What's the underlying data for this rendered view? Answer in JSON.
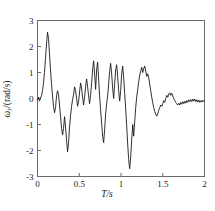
{
  "chart_data": {
    "type": "line",
    "title": "",
    "xlabel": "T/s",
    "ylabel": "ωy/(rad/s)",
    "ylabel_symbol": "ω",
    "ylabel_subscript": "y",
    "ylabel_unit": "/(rad/s)",
    "xlim": [
      0,
      2
    ],
    "ylim": [
      -3,
      3
    ],
    "xticks": [
      0,
      0.5,
      1,
      1.5,
      2
    ],
    "xtick_labels": [
      "0",
      "0.5",
      "1",
      "1.5",
      "2"
    ],
    "yticks": [
      -3,
      -2,
      -1,
      0,
      1,
      2,
      3
    ],
    "ytick_labels": [
      "-3",
      "-2",
      "-1",
      "0",
      "1",
      "2",
      "3"
    ],
    "grid": false,
    "legend": false,
    "line_color": "#1a1a1a",
    "line_width": 0.9,
    "frame": true,
    "tick_direction": "in",
    "series": [
      {
        "name": "angular velocity y",
        "x": [
          0.0,
          0.012,
          0.024,
          0.036,
          0.048,
          0.06,
          0.072,
          0.084,
          0.096,
          0.108,
          0.12,
          0.132,
          0.144,
          0.156,
          0.168,
          0.18,
          0.192,
          0.204,
          0.216,
          0.228,
          0.24,
          0.252,
          0.264,
          0.276,
          0.288,
          0.3,
          0.312,
          0.324,
          0.336,
          0.348,
          0.36,
          0.372,
          0.384,
          0.396,
          0.408,
          0.42,
          0.432,
          0.444,
          0.456,
          0.468,
          0.48,
          0.492,
          0.504,
          0.516,
          0.528,
          0.54,
          0.552,
          0.564,
          0.576,
          0.588,
          0.6,
          0.612,
          0.624,
          0.636,
          0.648,
          0.66,
          0.672,
          0.684,
          0.696,
          0.708,
          0.72,
          0.732,
          0.744,
          0.756,
          0.768,
          0.78,
          0.792,
          0.804,
          0.816,
          0.828,
          0.84,
          0.852,
          0.864,
          0.876,
          0.888,
          0.9,
          0.912,
          0.924,
          0.936,
          0.948,
          0.96,
          0.972,
          0.984,
          0.996,
          1.008,
          1.02,
          1.032,
          1.044,
          1.056,
          1.068,
          1.08,
          1.092,
          1.104,
          1.116,
          1.128,
          1.14,
          1.152,
          1.164,
          1.176,
          1.188,
          1.2,
          1.212,
          1.224,
          1.236,
          1.248,
          1.26,
          1.272,
          1.284,
          1.296,
          1.308,
          1.32,
          1.332,
          1.344,
          1.356,
          1.368,
          1.38,
          1.392,
          1.404,
          1.416,
          1.428,
          1.44,
          1.452,
          1.464,
          1.476,
          1.488,
          1.5,
          1.512,
          1.524,
          1.536,
          1.548,
          1.56,
          1.572,
          1.584,
          1.596,
          1.608,
          1.62,
          1.632,
          1.644,
          1.656,
          1.668,
          1.68,
          1.692,
          1.704,
          1.716,
          1.728,
          1.74,
          1.752,
          1.764,
          1.776,
          1.788,
          1.8,
          1.812,
          1.824,
          1.836,
          1.848,
          1.86,
          1.872,
          1.884,
          1.896,
          1.908,
          1.92,
          1.932,
          1.944,
          1.956,
          1.968,
          1.98,
          1.992,
          2.0
        ],
        "y": [
          -0.05,
          0.05,
          -0.1,
          0.02,
          0.1,
          0.3,
          0.6,
          1.0,
          1.55,
          2.1,
          2.55,
          2.3,
          1.7,
          1.1,
          0.55,
          0.1,
          -0.3,
          -0.55,
          -0.35,
          0.1,
          0.3,
          0.15,
          -0.25,
          -0.7,
          -1.15,
          -1.4,
          -1.15,
          -0.7,
          -1.1,
          -1.6,
          -2.05,
          -1.7,
          -1.1,
          -0.65,
          -0.3,
          -0.05,
          0.15,
          0.45,
          0.3,
          0.0,
          -0.3,
          -0.1,
          0.25,
          0.6,
          0.4,
          0.05,
          -0.25,
          0.05,
          0.45,
          0.75,
          0.45,
          0.1,
          -0.2,
          0.15,
          0.6,
          1.1,
          1.45,
          0.95,
          0.35,
          1.1,
          1.4,
          0.75,
          0.1,
          -0.45,
          -0.95,
          -1.45,
          -1.7,
          -1.2,
          -0.6,
          -0.2,
          0.1,
          0.55,
          1.05,
          1.35,
          0.95,
          0.4,
          0.0,
          0.55,
          1.1,
          1.3,
          0.85,
          0.3,
          -0.1,
          0.3,
          0.95,
          1.25,
          0.8,
          0.2,
          -0.4,
          -1.05,
          -1.75,
          -2.35,
          -2.7,
          -2.25,
          -1.6,
          -1.0,
          -1.45,
          -0.9,
          -0.35,
          0.05,
          0.35,
          0.65,
          0.9,
          1.05,
          1.2,
          1.0,
          1.15,
          1.25,
          1.05,
          0.85,
          0.95,
          0.8,
          0.55,
          0.3,
          0.05,
          -0.15,
          -0.35,
          -0.5,
          -0.6,
          -0.68,
          -0.6,
          -0.45,
          -0.35,
          -0.25,
          -0.3,
          -0.2,
          -0.08,
          -0.15,
          0.0,
          0.12,
          0.05,
          0.18,
          0.22,
          0.12,
          0.2,
          0.1,
          0.0,
          -0.08,
          -0.15,
          -0.2,
          -0.25,
          -0.18,
          -0.25,
          -0.15,
          -0.22,
          -0.12,
          -0.2,
          -0.1,
          -0.18,
          -0.08,
          -0.15,
          -0.05,
          -0.12,
          -0.04,
          -0.12,
          -0.02,
          -0.1,
          -0.02,
          -0.12,
          -0.05,
          -0.14,
          -0.06,
          -0.15,
          -0.08,
          -0.14,
          -0.06,
          -0.12,
          -0.1
        ]
      }
    ]
  },
  "axes": {
    "xlabel_display": "T/s",
    "ylabel_display": "ωy/(rad/s)"
  }
}
